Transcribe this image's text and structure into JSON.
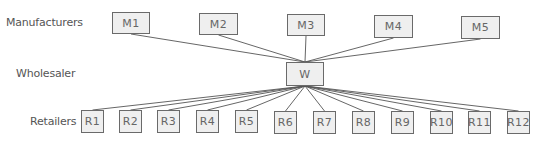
{
  "diagram": {
    "row_labels": {
      "manufacturers": "Manufacturers",
      "wholesaler": "Wholesaler",
      "retailers": "Retailers"
    },
    "manufacturers": [
      {
        "id": "M1",
        "x": 112,
        "y": 12,
        "w": 38,
        "h": 22
      },
      {
        "id": "M2",
        "x": 199,
        "y": 13,
        "w": 39,
        "h": 22
      },
      {
        "id": "M3",
        "x": 287,
        "y": 14,
        "w": 38,
        "h": 22
      },
      {
        "id": "M4",
        "x": 374,
        "y": 15,
        "w": 39,
        "h": 23
      },
      {
        "id": "M5",
        "x": 461,
        "y": 16,
        "w": 39,
        "h": 23
      }
    ],
    "wholesaler": {
      "id": "W",
      "x": 286,
      "y": 62,
      "w": 38,
      "h": 24
    },
    "retailers": [
      {
        "id": "R1",
        "x": 81,
        "y": 110
      },
      {
        "id": "R2",
        "x": 119,
        "y": 110
      },
      {
        "id": "R3",
        "x": 157,
        "y": 110
      },
      {
        "id": "R4",
        "x": 196,
        "y": 110
      },
      {
        "id": "R5",
        "x": 235,
        "y": 110
      },
      {
        "id": "R6",
        "x": 274,
        "y": 111
      },
      {
        "id": "R7",
        "x": 313,
        "y": 111
      },
      {
        "id": "R8",
        "x": 352,
        "y": 111
      },
      {
        "id": "R9",
        "x": 391,
        "y": 111
      },
      {
        "id": "R10",
        "x": 430,
        "y": 111
      },
      {
        "id": "R11",
        "x": 468,
        "y": 111
      },
      {
        "id": "R12",
        "x": 507,
        "y": 111
      }
    ],
    "retailer_size": {
      "w": 23,
      "h": 23
    },
    "colors": {
      "box_fill": "#efefef",
      "box_border": "#6a6a6a",
      "line": "#555555",
      "text": "#666666"
    }
  }
}
